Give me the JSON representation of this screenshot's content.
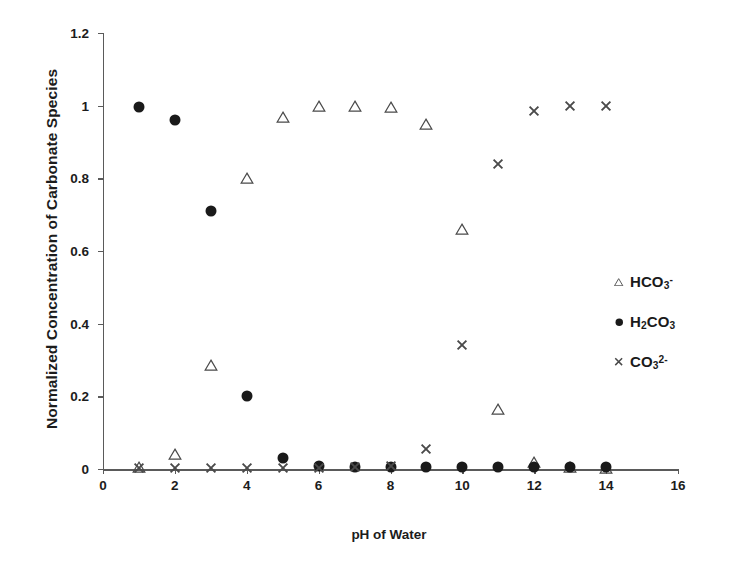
{
  "chart_data": {
    "type": "scatter",
    "title": "",
    "xlabel": "pH of Water",
    "ylabel": "Normalized Concentration of Carbonate Species",
    "xlim": [
      0,
      16
    ],
    "ylim": [
      0,
      1.2
    ],
    "xticks": [
      0,
      2,
      4,
      6,
      8,
      10,
      12,
      14,
      16
    ],
    "xtick_labels": [
      "0",
      "2",
      "4",
      "6",
      "8",
      "10",
      "12",
      "14",
      "16"
    ],
    "yticks": [
      0,
      0.2,
      0.4,
      0.6,
      0.8,
      1,
      1.2
    ],
    "ytick_labels": [
      "0",
      "0.2",
      "0.4",
      "0.6",
      "0.8",
      "1",
      "1.2"
    ],
    "grid": false,
    "legend_position": "right-inside",
    "x": [
      1,
      2,
      3,
      4,
      5,
      6,
      7,
      8,
      9,
      10,
      11,
      12,
      13,
      14
    ],
    "series": [
      {
        "name": "HCO3-",
        "label_html": "HCO<sub>3</sub><sup>-</sup>",
        "marker": "triangle-open",
        "color": "#4a4a4a",
        "values": [
          0.005,
          0.04,
          0.285,
          0.8,
          0.97,
          1.0,
          1.0,
          0.995,
          0.95,
          0.66,
          0.165,
          0.02,
          0.005,
          0.002
        ]
      },
      {
        "name": "H2CO3",
        "label_html": "H<sub>2</sub>CO<sub>3</sub>",
        "marker": "circle-filled",
        "color": "#1a1a1a",
        "values": [
          0.995,
          0.96,
          0.71,
          0.2,
          0.03,
          0.008,
          0.006,
          0.006,
          0.005,
          0.005,
          0.005,
          0.005,
          0.005,
          0.005
        ]
      },
      {
        "name": "CO3 2-",
        "label_html": "CO<sub>3</sub><sup>2-</sup>",
        "marker": "x-cross",
        "color": "#4a4a4a",
        "values": [
          0.004,
          0.004,
          0.004,
          0.004,
          0.004,
          0.004,
          0.005,
          0.008,
          0.055,
          0.34,
          0.84,
          0.985,
          1.0,
          1.0
        ]
      }
    ]
  },
  "legend": {
    "entries": [
      {
        "symbol": "triangle-open",
        "label_html": "HCO<sub>3</sub><sup>-</sup>"
      },
      {
        "symbol": "circle-filled",
        "label_html": "H<sub>2</sub>CO<sub>3</sub>"
      },
      {
        "symbol": "x-cross",
        "label_html": "CO<sub>3</sub><sup>2-</sup>"
      }
    ]
  },
  "colors": {
    "axis": "#5a5a5a",
    "text": "#1a1a1a",
    "marker_open": "#4a4a4a",
    "marker_filled": "#1a1a1a",
    "background": "#ffffff"
  }
}
